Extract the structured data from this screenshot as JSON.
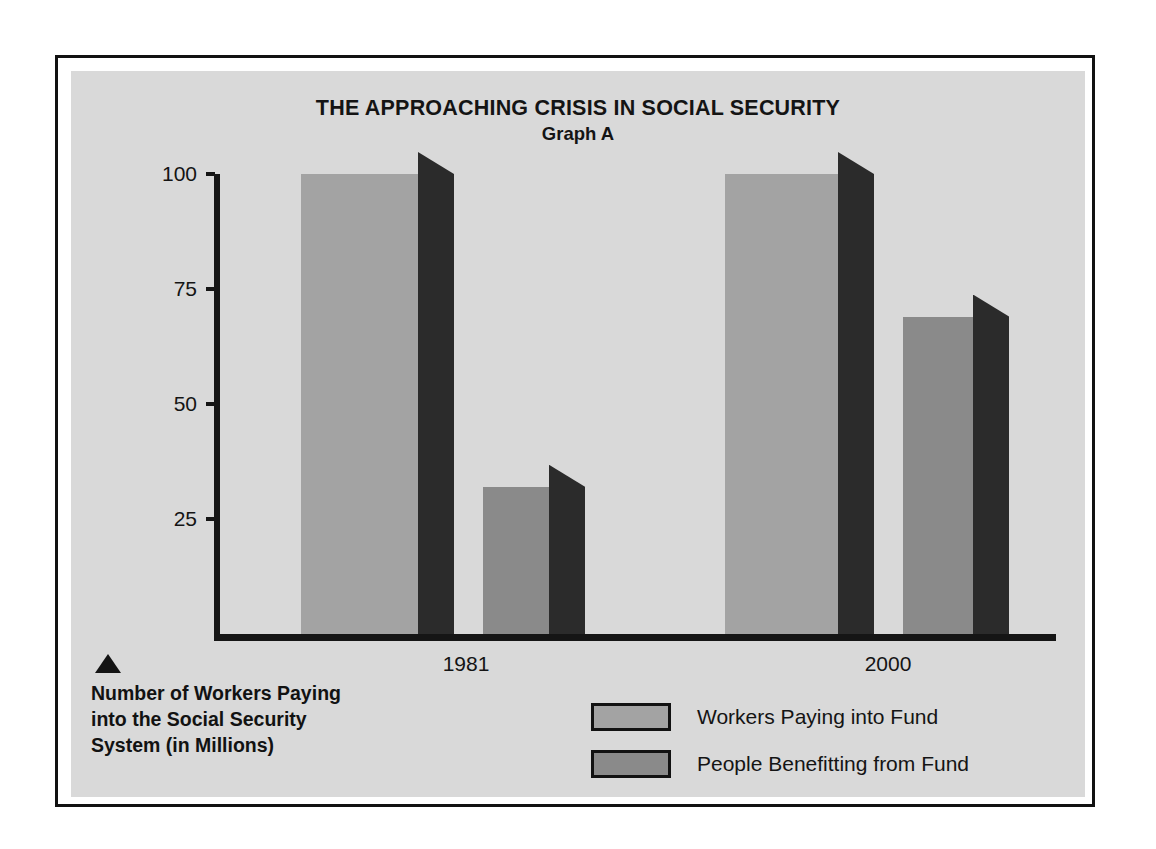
{
  "chart_data": {
    "type": "bar",
    "title": "THE APPROACHING CRISIS IN SOCIAL SECURITY",
    "subtitle": "Graph A",
    "xlabel": "",
    "ylabel": "Number of Workers Paying into the Social Security System (in Millions)",
    "categories": [
      "1981",
      "2000"
    ],
    "series": [
      {
        "name": "Workers Paying into Fund",
        "values": [
          100,
          100
        ],
        "color": "#a3a3a3"
      },
      {
        "name": "People Benefitting from Fund",
        "values": [
          32,
          69
        ],
        "color": "#8a8a8a"
      }
    ],
    "ylim": [
      0,
      108
    ],
    "yticks": [
      100,
      75,
      50,
      25
    ],
    "ytick_labels": [
      "100",
      "75",
      "50",
      "25"
    ],
    "grid": false,
    "legend_position": "bottom-center",
    "side_face_color": "#2b2b2b",
    "panel_color": "#d9d9d9",
    "axis_color": "#151515"
  },
  "figure": {
    "title": "THE APPROACHING CRISIS IN SOCIAL SECURITY",
    "subtitle": "Graph A",
    "axis_caption": "Number of Workers Paying into the Social Security System (in Millions)",
    "axis_caption_lines": [
      "Number of Workers Paying",
      "into the Social Security",
      "System (in Millions)"
    ],
    "y_ticks": [
      {
        "label": "100",
        "value": 100
      },
      {
        "label": "75",
        "value": 75
      },
      {
        "label": "50",
        "value": 50
      },
      {
        "label": "25",
        "value": 25
      }
    ],
    "x_ticks": [
      {
        "label": "1981"
      },
      {
        "label": "2000"
      }
    ],
    "legend": [
      {
        "label": "Workers Paying into Fund",
        "color": "#a3a3a3"
      },
      {
        "label": "People Benefitting from Fund",
        "color": "#8a8a8a"
      }
    ],
    "bars": [
      {
        "group": "1981",
        "series": "Workers Paying into Fund",
        "value": 100
      },
      {
        "group": "1981",
        "series": "People Benefitting from Fund",
        "value": 32
      },
      {
        "group": "2000",
        "series": "Workers Paying into Fund",
        "value": 100
      },
      {
        "group": "2000",
        "series": "People Benefitting from Fund",
        "value": 69
      }
    ]
  }
}
